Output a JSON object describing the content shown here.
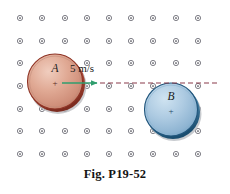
{
  "figure": {
    "caption": "Fig. P19-52",
    "background_color": "#ffffff",
    "width": 230,
    "height": 194
  },
  "field_grid": {
    "name": "magnetic-field-out-of-page-dots",
    "symbol": "dot-in-circle",
    "columns_x": [
      20,
      42,
      65,
      87,
      109,
      131,
      153,
      176,
      198
    ],
    "rows_y": [
      18,
      41,
      63,
      86,
      109,
      131,
      154
    ],
    "ring_radius": 2.6,
    "ring_color": "#6f6f78",
    "dot_color": "#3d3d46"
  },
  "disks": [
    {
      "id": "disk-a",
      "label": "A",
      "cx": 55,
      "cy": 82,
      "r": 28,
      "fill_light": "#e8b9a8",
      "fill_mid": "#d99e8b",
      "fill_dark": "#c8806d",
      "rim_color": "#a33b2c",
      "shadow_color": "#b8b8bd",
      "center_mark": "+"
    },
    {
      "id": "disk-b",
      "label": "B",
      "cx": 171,
      "cy": 110,
      "r": 27,
      "fill_light": "#bcd6e8",
      "fill_mid": "#9dc2dc",
      "fill_dark": "#7fa9c9",
      "rim_color": "#2a6a94",
      "shadow_color": "#b4b9be",
      "center_mark": "+"
    }
  ],
  "velocity_arrow": {
    "label": "5 m/s",
    "color": "#2f9e6e",
    "x1": 62,
    "x2": 100,
    "y": 83,
    "label_x": 70,
    "label_y": 62
  },
  "trajectory_line": {
    "name": "dashed-path",
    "color": "#8a3a4a",
    "x1": 100,
    "x2": 217,
    "y": 83,
    "dash": "5 3"
  }
}
